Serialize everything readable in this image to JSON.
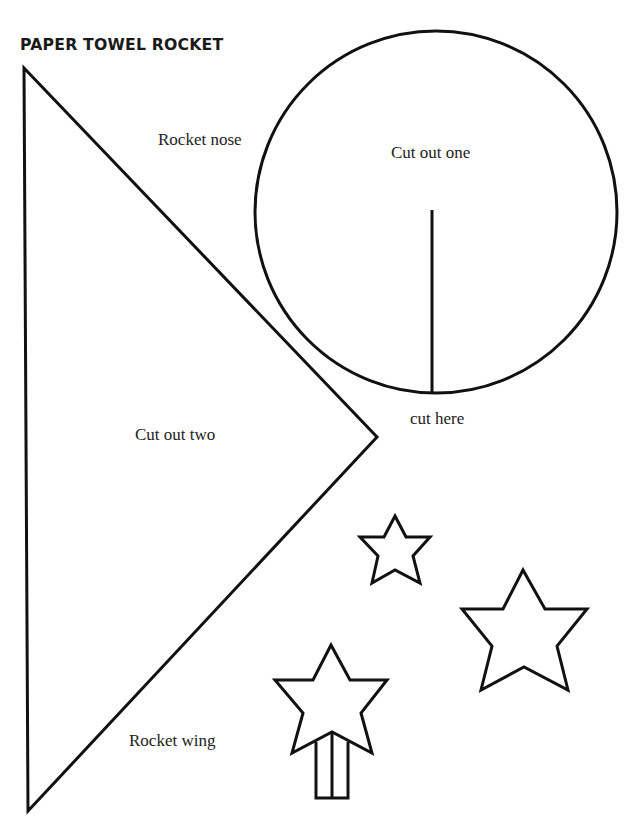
{
  "page": {
    "title": "PAPER TOWEL ROCKET",
    "labels": {
      "rocket_nose": "Rocket nose",
      "cut_out_one": "Cut out one",
      "cut_here": "cut here",
      "cut_out_two": "Cut out two",
      "rocket_wing": "Rocket wing"
    },
    "colors": {
      "outline": "#111111",
      "text": "#222222",
      "background": "#ffffff"
    }
  }
}
